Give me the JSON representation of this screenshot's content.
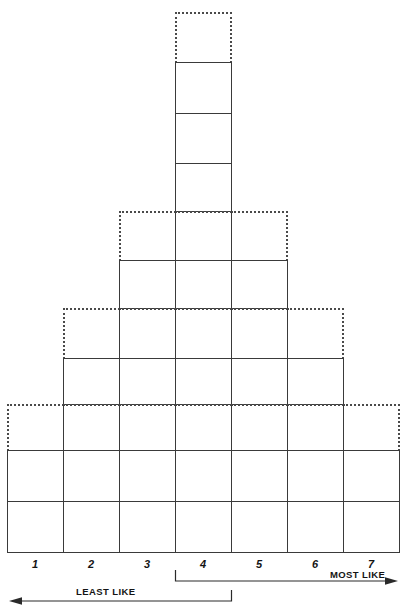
{
  "figure": {
    "type": "q-sort-pyramid",
    "columns": 7,
    "total_cells": 25,
    "line_color": "#3a3a3a",
    "dotted_color": "#4a4a4a",
    "background": "#ffffff"
  },
  "axis": {
    "numbers": [
      "1",
      "2",
      "3",
      "4",
      "5",
      "6",
      "7"
    ],
    "least_label": "LEAST LIKE",
    "most_label": "MOST LIKE",
    "left_arrow_icon": "arrow-left-icon",
    "right_arrow_icon": "arrow-right-icon",
    "neutral_bracket_column": "4"
  },
  "chart_data": {
    "type": "bar",
    "xlabel": "",
    "ylabel": "",
    "categories": [
      "1",
      "2",
      "3",
      "4",
      "5",
      "6",
      "7"
    ],
    "values": [
      3,
      4,
      6,
      11,
      6,
      4,
      3
    ],
    "ylim": [
      0,
      11
    ],
    "grid": true,
    "legend": "none",
    "annotations": [
      "LEAST LIKE",
      "MOST LIKE"
    ],
    "note": "Column heights in cells; topmost cell of each stack drawn with a dotted outline (optional/overflow slot)."
  },
  "cells": [
    {
      "col": 4,
      "row": 1,
      "style": "dotted"
    },
    {
      "col": 4,
      "row": 2,
      "style": "solid"
    },
    {
      "col": 4,
      "row": 3,
      "style": "solid"
    },
    {
      "col": 4,
      "row": 4,
      "style": "solid"
    },
    {
      "col": 3,
      "row": 5,
      "style": "dotted-left"
    },
    {
      "col": 4,
      "row": 5,
      "style": "dotted-mid"
    },
    {
      "col": 5,
      "row": 5,
      "style": "dotted-right"
    },
    {
      "col": 3,
      "row": 6,
      "style": "solid"
    },
    {
      "col": 4,
      "row": 6,
      "style": "solid"
    },
    {
      "col": 5,
      "row": 6,
      "style": "solid"
    },
    {
      "col": 2,
      "row": 7,
      "style": "dotted-left"
    },
    {
      "col": 3,
      "row": 7,
      "style": "dotted-mid"
    },
    {
      "col": 4,
      "row": 7,
      "style": "dotted-mid"
    },
    {
      "col": 5,
      "row": 7,
      "style": "dotted-mid"
    },
    {
      "col": 6,
      "row": 7,
      "style": "dotted-right"
    },
    {
      "col": 2,
      "row": 8,
      "style": "solid"
    },
    {
      "col": 3,
      "row": 8,
      "style": "solid"
    },
    {
      "col": 4,
      "row": 8,
      "style": "solid"
    },
    {
      "col": 5,
      "row": 8,
      "style": "solid"
    },
    {
      "col": 6,
      "row": 8,
      "style": "solid"
    },
    {
      "col": 1,
      "row": 9,
      "style": "dotted-left"
    },
    {
      "col": 2,
      "row": 9,
      "style": "dotted-mid"
    },
    {
      "col": 3,
      "row": 9,
      "style": "dotted-mid"
    },
    {
      "col": 4,
      "row": 9,
      "style": "dotted-mid"
    },
    {
      "col": 5,
      "row": 9,
      "style": "dotted-mid"
    },
    {
      "col": 6,
      "row": 9,
      "style": "dotted-mid"
    },
    {
      "col": 7,
      "row": 9,
      "style": "dotted-right"
    },
    {
      "col": 1,
      "row": 10,
      "style": "solid"
    },
    {
      "col": 2,
      "row": 10,
      "style": "solid"
    },
    {
      "col": 3,
      "row": 10,
      "style": "solid"
    },
    {
      "col": 4,
      "row": 10,
      "style": "solid"
    },
    {
      "col": 5,
      "row": 10,
      "style": "solid"
    },
    {
      "col": 6,
      "row": 10,
      "style": "solid"
    },
    {
      "col": 7,
      "row": 10,
      "style": "solid"
    },
    {
      "col": 1,
      "row": 11,
      "style": "solid"
    },
    {
      "col": 2,
      "row": 11,
      "style": "solid"
    },
    {
      "col": 3,
      "row": 11,
      "style": "solid"
    },
    {
      "col": 4,
      "row": 11,
      "style": "solid"
    },
    {
      "col": 5,
      "row": 11,
      "style": "solid"
    },
    {
      "col": 6,
      "row": 11,
      "style": "solid"
    },
    {
      "col": 7,
      "row": 11,
      "style": "solid"
    }
  ],
  "geometry": {
    "col_x": [
      7,
      63,
      119,
      175,
      231,
      287,
      343,
      399
    ],
    "row_y": [
      12,
      62,
      113,
      163,
      211,
      260,
      308,
      358,
      404,
      450,
      501,
      552
    ]
  }
}
